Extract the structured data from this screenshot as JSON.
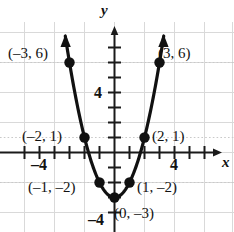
{
  "chart_data": {
    "type": "scatter",
    "title": "",
    "subtitle": "",
    "xlabel": "x",
    "ylabel": "y",
    "xlim": [
      -6.2,
      6.8
    ],
    "ylim": [
      -4.9,
      7.6
    ],
    "grid": true,
    "grid_step": 2,
    "tick_step": 1,
    "legend": "none",
    "curve": {
      "name": "parabola",
      "equation": "y = x^2 - 3",
      "arrows": [
        "up-left",
        "up-right"
      ],
      "color": "#111111"
    },
    "x": [
      -3,
      -2,
      -1,
      0,
      1,
      2,
      3
    ],
    "y": [
      6,
      1,
      -2,
      -3,
      -2,
      1,
      6
    ],
    "points": [
      {
        "x": -3,
        "y": 6,
        "label": "(–3, 6)",
        "label_side": "left"
      },
      {
        "x": -2,
        "y": 1,
        "label": "(–2, 1)",
        "label_side": "left"
      },
      {
        "x": -1,
        "y": -2,
        "label": "(–1, –2)",
        "label_side": "left"
      },
      {
        "x": 0,
        "y": -3,
        "label": "(0, –3)",
        "label_side": "right"
      },
      {
        "x": 1,
        "y": -2,
        "label": "(1, –2)",
        "label_side": "right"
      },
      {
        "x": 2,
        "y": 1,
        "label": "(2, 1)",
        "label_side": "right"
      },
      {
        "x": 3,
        "y": 6,
        "label": "(3, 6)",
        "label_side": "right"
      }
    ],
    "xticks_labeled": [
      {
        "value": -4,
        "text": "–4"
      },
      {
        "value": 4,
        "text": "4"
      }
    ],
    "yticks_labeled": [
      {
        "value": 4,
        "text": "4"
      },
      {
        "value": -4,
        "text": "–4"
      }
    ],
    "colors": {
      "grid": "#d8d8d8",
      "axis": "#1a1a1a",
      "curve": "#111111",
      "point": "#111111",
      "background": "#ffffff",
      "text": "#111111"
    }
  },
  "axes": {
    "x_axis_label": "x",
    "y_axis_label": "y"
  },
  "point_labels": {
    "p_neg3_6": "(–3, 6)",
    "p_neg2_1": "(–2, 1)",
    "p_neg1_neg2": "(–1, –2)",
    "p_0_neg3": "(0, –3)",
    "p_1_neg2": "(1, –2)",
    "p_2_1": "(2, 1)",
    "p_3_6": "(3, 6)"
  },
  "tick_labels": {
    "x_neg4": "–4",
    "x_pos4": "4",
    "y_pos4": "4",
    "y_neg4": "–4"
  }
}
